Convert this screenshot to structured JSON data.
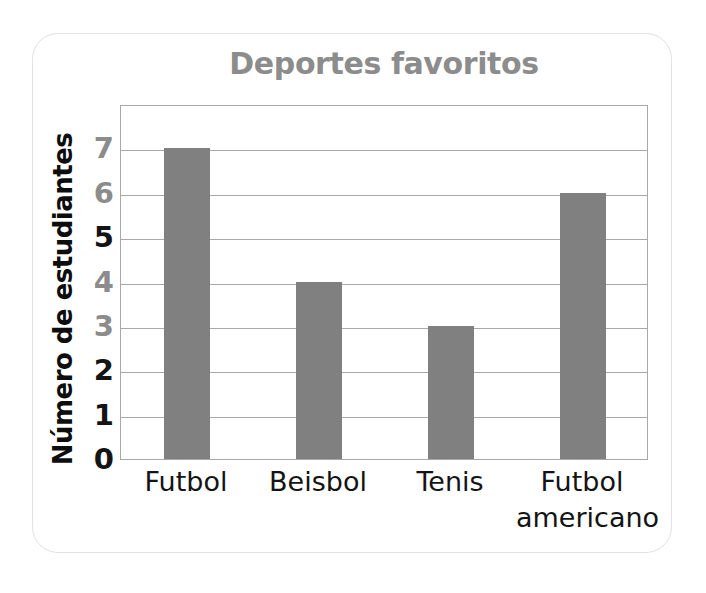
{
  "card": {
    "background_color": "#ffffff",
    "border_color": "#e2e2e2"
  },
  "chart_data": {
    "type": "bar",
    "title": "Deportes favoritos",
    "xlabel": "",
    "ylabel": "Número de estudiantes",
    "categories": [
      "Futbol",
      "Beisbol",
      "Tenis",
      "Futbol americano"
    ],
    "values": [
      7,
      4,
      3,
      6
    ],
    "ylim": [
      0,
      8
    ],
    "yticks": [
      0,
      1,
      2,
      3,
      4,
      5,
      6,
      7
    ],
    "ytick_labels": [
      "0",
      "1",
      "2",
      "3",
      "4",
      "5",
      "6",
      "7"
    ],
    "grid": true,
    "grid_orientation": "horizontal",
    "legend": false,
    "legend_position": "none",
    "bar_color": "#808080",
    "axis_color": "#a8a8a8",
    "title_color": "#8c8c8c",
    "label_color": "#141414"
  },
  "y_axis": {
    "title": "Número de estudiantes",
    "ticks": [
      {
        "label": "7",
        "value": 7,
        "color": "#8c8c8c"
      },
      {
        "label": "6",
        "value": 6,
        "color": "#8c8c8c"
      },
      {
        "label": "5",
        "value": 5,
        "color": "#141414"
      },
      {
        "label": "4",
        "value": 4,
        "color": "#8c8c8c"
      },
      {
        "label": "3",
        "value": 3,
        "color": "#8c8c8c"
      },
      {
        "label": "2",
        "value": 2,
        "color": "#141414"
      },
      {
        "label": "1",
        "value": 1,
        "color": "#141414"
      },
      {
        "label": "0",
        "value": 0,
        "color": "#141414"
      }
    ]
  },
  "x_axis": {
    "ticks": [
      {
        "line1": "Futbol",
        "line2": ""
      },
      {
        "line1": "Beisbol",
        "line2": ""
      },
      {
        "line1": "Tenis",
        "line2": ""
      },
      {
        "line1": "Futbol",
        "line2": "americano"
      }
    ]
  },
  "bars": [
    {
      "category": "Futbol",
      "value": 7
    },
    {
      "category": "Beisbol",
      "value": 4
    },
    {
      "category": "Tenis",
      "value": 3
    },
    {
      "category": "Futbol americano",
      "value": 6
    }
  ]
}
